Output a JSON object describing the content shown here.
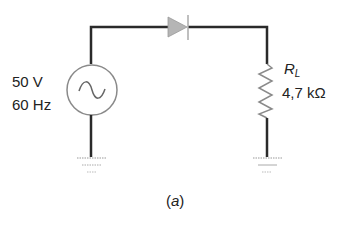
{
  "diagram": {
    "type": "circuit",
    "caption": "(a)",
    "caption_letter": "a",
    "source": {
      "symbol": "ac-voltage-source",
      "voltage": "50 V",
      "frequency": "60 Hz"
    },
    "diode": {
      "symbol": "diode"
    },
    "load": {
      "symbol": "resistor",
      "name": "R",
      "subscript": "L",
      "value": "4,7 kΩ"
    },
    "grounds": [
      "ground-left",
      "ground-right"
    ],
    "colors": {
      "wire": "#2a2a2a",
      "component": "#8a8a8a",
      "text": "#222222"
    }
  }
}
